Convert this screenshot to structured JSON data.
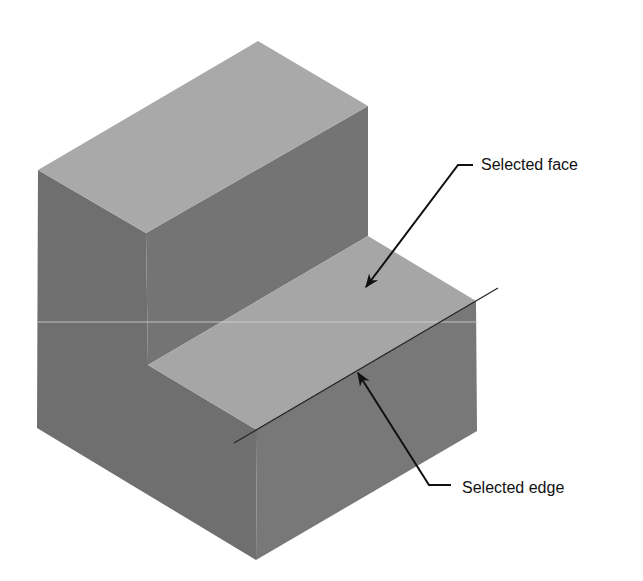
{
  "figure": {
    "type": "isometric-step-block",
    "colors": {
      "background": "#ffffff",
      "top_face": "#a9a9a9",
      "step_face": "#a6a6a6",
      "left_face": "#6f6f6f",
      "right_face": "#787878",
      "inner_riser": "#747474",
      "leader": "#111111",
      "selected_edge": "#222222"
    }
  },
  "annotations": [
    {
      "id": "selected-face",
      "label": "Selected face"
    },
    {
      "id": "selected-edge",
      "label": "Selected edge"
    }
  ]
}
